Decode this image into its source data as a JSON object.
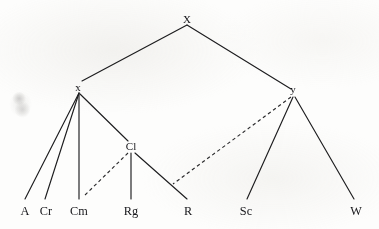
{
  "diagram": {
    "type": "tree-diagram",
    "title": "",
    "background_color": "#fdfdfc",
    "ink_color": "#1d1d1f",
    "nodes": [
      {
        "id": "X",
        "label": "X",
        "kind": "root",
        "x": 187,
        "y": 19,
        "anchor_x": 187,
        "anchor_y": 25
      },
      {
        "id": "x",
        "label": "x",
        "kind": "internal",
        "x": 78,
        "y": 87,
        "anchor_x": 79,
        "anchor_y": 93
      },
      {
        "id": "y",
        "label": "y",
        "kind": "internal",
        "x": 293,
        "y": 89,
        "anchor_x": 294,
        "anchor_y": 95
      },
      {
        "id": "Cl",
        "label": "Cl",
        "kind": "internal",
        "x": 131,
        "y": 146,
        "anchor_x": 131,
        "anchor_y": 152
      },
      {
        "id": "A",
        "label": "A",
        "kind": "leaf",
        "x": 25,
        "y": 211,
        "anchor_x": 25,
        "anchor_y": 199
      },
      {
        "id": "Cr",
        "label": "Cr",
        "kind": "leaf",
        "x": 46,
        "y": 211,
        "anchor_x": 45,
        "anchor_y": 199
      },
      {
        "id": "Cm",
        "label": "Cm",
        "kind": "leaf",
        "x": 79,
        "y": 211,
        "anchor_x": 79,
        "anchor_y": 199
      },
      {
        "id": "Rg",
        "label": "Rg",
        "kind": "leaf",
        "x": 131,
        "y": 211,
        "anchor_x": 131,
        "anchor_y": 199
      },
      {
        "id": "R",
        "label": "R",
        "kind": "leaf",
        "x": 188,
        "y": 211,
        "anchor_x": 187,
        "anchor_y": 199
      },
      {
        "id": "Sc",
        "label": "Sc",
        "kind": "leaf",
        "x": 246,
        "y": 211,
        "anchor_x": 247,
        "anchor_y": 199
      },
      {
        "id": "W",
        "label": "W",
        "kind": "leaf",
        "x": 356,
        "y": 211,
        "anchor_x": 354,
        "anchor_y": 199
      }
    ],
    "edges": [
      {
        "id": "X-x",
        "from": "X",
        "to": "x",
        "style": "solid",
        "points": "187,25 82,81"
      },
      {
        "id": "X-y",
        "from": "X",
        "to": "y",
        "style": "solid",
        "points": "187,25 291,89"
      },
      {
        "id": "x-A",
        "from": "x",
        "to": "A",
        "style": "solid",
        "points": "79,93 25,199"
      },
      {
        "id": "x-Cr",
        "from": "x",
        "to": "Cr",
        "style": "solid",
        "points": "79,93 45,199"
      },
      {
        "id": "x-Cm",
        "from": "x",
        "to": "Cm",
        "style": "solid",
        "points": "79,93 79,199"
      },
      {
        "id": "x-Cl",
        "from": "x",
        "to": "Cl",
        "style": "solid",
        "points": "80,94 128,141"
      },
      {
        "id": "Cl-Cm",
        "from": "Cl",
        "to": "Cm",
        "style": "dashed",
        "points": "128,153 83,197"
      },
      {
        "id": "Cl-Rg",
        "from": "Cl",
        "to": "Rg",
        "style": "solid",
        "points": "131,153 131,199"
      },
      {
        "id": "Cl-R",
        "from": "Cl",
        "to": "R",
        "style": "solid",
        "points": "135,153 187,199"
      },
      {
        "id": "y-R",
        "from": "y",
        "to": "R",
        "style": "dashed",
        "points": "291,97 173,184"
      },
      {
        "id": "y-Sc",
        "from": "y",
        "to": "Sc",
        "style": "solid",
        "points": "293,97 247,199"
      },
      {
        "id": "y-W",
        "from": "y",
        "to": "W",
        "style": "solid",
        "points": "295,97 354,199"
      }
    ],
    "artifacts": [
      {
        "id": "scan-smudge",
        "kind": "smudge",
        "x": 9,
        "y": 90,
        "width": 24,
        "height": 28
      }
    ]
  }
}
